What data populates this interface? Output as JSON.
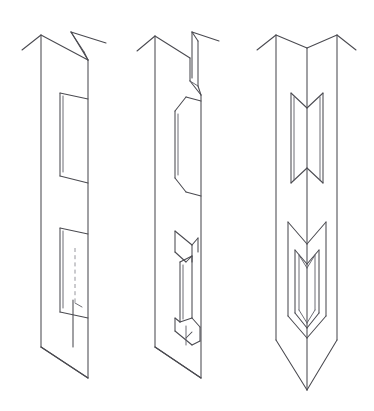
{
  "document": {
    "title": "Isometric joinery detail drawing",
    "subject": "Post with V-shaped mortise and tenon joints",
    "background_color": "#ffffff",
    "line_color": "#4a4a50",
    "hidden_line_color": "#8a8a92",
    "line_style": "thin continuous with dashed hidden edges",
    "projection": "axonometric / isometric",
    "view_count": 3,
    "has_text_labels": false,
    "has_dimensions": false
  },
  "figures": [
    {
      "id": "figure-1",
      "name": "post-plain-face-view",
      "label": "",
      "position": {
        "x": 20,
        "y": 25,
        "width": 105,
        "height": 365
      },
      "description": "Square post shown in axonometric view with chamfered double-peak top, one open rectangular mortise in the upper half and a second mortise in the lower half containing a dashed hidden edge.",
      "features": [
        {
          "name": "double-peak-chamfered-top",
          "type": "chamfer"
        },
        {
          "name": "upper-mortise-opening",
          "type": "mortise"
        },
        {
          "name": "lower-mortise-opening",
          "type": "mortise"
        },
        {
          "name": "hidden-edge-dashed-line",
          "type": "hidden-edge"
        },
        {
          "name": "flat-bottom-face",
          "type": "end-face"
        }
      ]
    },
    {
      "id": "figure-2",
      "name": "post-notched-tenon-view",
      "label": "",
      "position": {
        "x": 150,
        "y": 25,
        "width": 105,
        "height": 365
      },
      "description": "Same post rotated, showing the notched top with a narrow vertical slot, an open through-mortise in the upper half and a projecting three dimensional tenon tongue in the lower half.",
      "features": [
        {
          "name": "notched-slotted-top",
          "type": "slot"
        },
        {
          "name": "upper-through-mortise",
          "type": "mortise"
        },
        {
          "name": "projecting-tenon-tongue",
          "type": "tenon"
        },
        {
          "name": "tenon-shoulder-bevel",
          "type": "bevel"
        },
        {
          "name": "flat-bottom-face",
          "type": "end-face"
        }
      ]
    },
    {
      "id": "figure-3",
      "name": "post-corner-on-v-joint-view",
      "label": "",
      "position": {
        "x": 262,
        "y": 25,
        "width": 105,
        "height": 365
      },
      "description": "Post viewed corner on, symmetric about the vertical arris. The top forms a wide V valley between two peaks; an upper V shaped mortise window and a lower nested V shaped tenon seated inside its mortise; the bottom terminates in a V point.",
      "features": [
        {
          "name": "v-valley-top",
          "type": "chamfer"
        },
        {
          "name": "upper-v-mortise-window",
          "type": "mortise"
        },
        {
          "name": "lower-v-mortise-window",
          "type": "mortise"
        },
        {
          "name": "nested-v-tenon",
          "type": "tenon"
        },
        {
          "name": "v-point-bottom",
          "type": "end-face"
        }
      ]
    }
  ],
  "legend": {
    "solid_line_meaning": "visible edge",
    "dashed_line_meaning": "hidden edge"
  }
}
